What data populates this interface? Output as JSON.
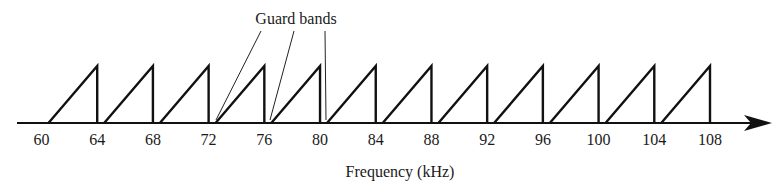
{
  "diagram": {
    "type": "frequency-division-multiplexing-spectrum",
    "annotation": {
      "label": "Guard bands",
      "pointer_count": 3
    },
    "axis": {
      "title": "Frequency (kHz)",
      "ticks": [
        "60",
        "64",
        "68",
        "72",
        "76",
        "80",
        "84",
        "88",
        "92",
        "96",
        "100",
        "104",
        "108"
      ]
    },
    "channels": [
      {
        "start_khz": 60.5,
        "end_khz": 64
      },
      {
        "start_khz": 64.5,
        "end_khz": 68
      },
      {
        "start_khz": 68.5,
        "end_khz": 72
      },
      {
        "start_khz": 72.5,
        "end_khz": 76
      },
      {
        "start_khz": 76.5,
        "end_khz": 80
      },
      {
        "start_khz": 80.5,
        "end_khz": 84
      },
      {
        "start_khz": 84.5,
        "end_khz": 88
      },
      {
        "start_khz": 88.5,
        "end_khz": 92
      },
      {
        "start_khz": 92.5,
        "end_khz": 96
      },
      {
        "start_khz": 96.5,
        "end_khz": 100
      },
      {
        "start_khz": 100.5,
        "end_khz": 104
      },
      {
        "start_khz": 104.5,
        "end_khz": 108
      }
    ],
    "colors": {
      "line": "#111111",
      "text": "#1a1a1a",
      "background": "#ffffff"
    }
  }
}
